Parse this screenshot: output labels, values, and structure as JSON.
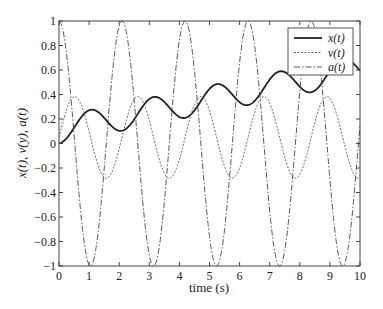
{
  "chart_data": {
    "type": "line",
    "title": "",
    "xlabel": "time (s)",
    "ylabel": "x(t), v(y), a(t)",
    "xlim": [
      0,
      10
    ],
    "ylim": [
      -1,
      1
    ],
    "xticks": [
      0,
      1,
      2,
      3,
      4,
      5,
      6,
      7,
      8,
      9,
      10
    ],
    "yticks": [
      -1,
      -0.8,
      -0.6,
      -0.4,
      -0.2,
      0,
      0.2,
      0.4,
      0.6,
      0.8,
      1
    ],
    "ytick_labels": [
      "−1",
      "−0.8",
      "−0.6",
      "−0.4",
      "−0.2",
      "0",
      "0.2",
      "0.4",
      "0.6",
      "0.8",
      "1"
    ],
    "grid": false,
    "legend_position": "upper right",
    "series": [
      {
        "name": "x(t)",
        "style": "solid",
        "formula": "0.05*t + (1 - cos(3t))/9",
        "x": [
          0,
          1,
          2,
          3,
          4,
          5,
          6,
          7,
          8,
          9,
          10
        ],
        "values": [
          0.0,
          0.26,
          0.2,
          0.26,
          0.31,
          0.35,
          0.38,
          0.43,
          0.47,
          0.53,
          0.59
        ]
      },
      {
        "name": "v(t)",
        "style": "dotted",
        "formula": "0.05 + sin(3t)/3",
        "x": [
          0,
          1,
          2,
          3,
          4,
          5,
          6,
          7,
          8,
          9,
          10
        ],
        "values": [
          0.05,
          0.1,
          -0.04,
          0.19,
          -0.13,
          0.27,
          -0.2,
          0.33,
          -0.26,
          0.37,
          -0.28
        ]
      },
      {
        "name": "a(t)",
        "style": "dashdot",
        "formula": "cos(3t)",
        "x": [
          0,
          1,
          2,
          3,
          4,
          5,
          6,
          7,
          8,
          9,
          10
        ],
        "values": [
          1.0,
          -0.99,
          0.96,
          -0.91,
          0.84,
          -0.76,
          0.66,
          -0.55,
          0.42,
          -0.29,
          0.15
        ]
      }
    ]
  }
}
